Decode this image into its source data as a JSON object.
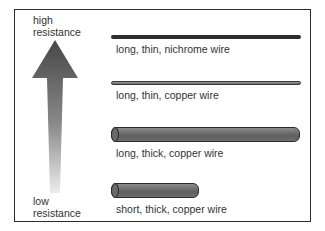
{
  "scale": {
    "high_label": [
      "high",
      "resistance"
    ],
    "low_label": [
      "low",
      "resistance"
    ],
    "arrow_direction": "up",
    "gradient_top_color": "#4a4a4a",
    "gradient_bottom_color": "#e8e8e8"
  },
  "wires": [
    {
      "label": "long, thin, nichrome wire",
      "length": "long",
      "thickness": "thin",
      "material": "nichrome",
      "color": "#2e2e2e"
    },
    {
      "label": "long, thin, copper wire",
      "length": "long",
      "thickness": "thin",
      "material": "copper",
      "color": "#7a7a7a"
    },
    {
      "label": "long, thick, copper wire",
      "length": "long",
      "thickness": "thick",
      "material": "copper",
      "color": "#6e6e6e"
    },
    {
      "label": "short, thick, copper wire",
      "length": "short",
      "thickness": "thick",
      "material": "copper",
      "color": "#6e6e6e"
    }
  ]
}
